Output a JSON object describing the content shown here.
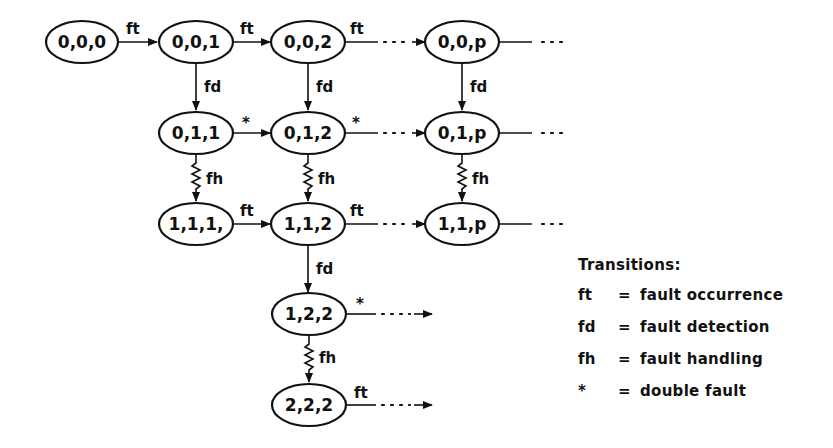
{
  "diagram": {
    "type": "state-transition",
    "nodes": [
      {
        "id": "n000",
        "label": "0,0,0",
        "cx": 82,
        "cy": 42
      },
      {
        "id": "n001",
        "label": "0,0,1",
        "cx": 196,
        "cy": 42
      },
      {
        "id": "n002",
        "label": "0,0,2",
        "cx": 308,
        "cy": 42
      },
      {
        "id": "n00p",
        "label": "0,0,p",
        "cx": 462,
        "cy": 42
      },
      {
        "id": "n011",
        "label": "0,1,1",
        "cx": 196,
        "cy": 133
      },
      {
        "id": "n012",
        "label": "0,1,2",
        "cx": 308,
        "cy": 133
      },
      {
        "id": "n01p",
        "label": "0,1,p",
        "cx": 462,
        "cy": 133
      },
      {
        "id": "n111",
        "label": "1,1,1,",
        "cx": 196,
        "cy": 224
      },
      {
        "id": "n112",
        "label": "1,1,2",
        "cx": 308,
        "cy": 224
      },
      {
        "id": "n11p",
        "label": "1,1,p",
        "cx": 462,
        "cy": 224
      },
      {
        "id": "n122",
        "label": "1,2,2",
        "cx": 309,
        "cy": 314
      },
      {
        "id": "n222",
        "label": "2,2,2",
        "cx": 309,
        "cy": 405
      }
    ],
    "edges": [
      {
        "from": "0,0,0",
        "to": "0,0,1",
        "label": "ft",
        "style": "solid"
      },
      {
        "from": "0,0,1",
        "to": "0,0,2",
        "label": "ft",
        "style": "solid"
      },
      {
        "from": "0,0,2",
        "to": "0,0,p",
        "label": "ft",
        "style": "dotted"
      },
      {
        "from": "0,0,p",
        "to": "...",
        "label": "",
        "style": "dotted"
      },
      {
        "from": "0,0,1",
        "to": "0,1,1",
        "label": "fd",
        "style": "solid"
      },
      {
        "from": "0,0,2",
        "to": "0,1,2",
        "label": "fd",
        "style": "solid"
      },
      {
        "from": "0,0,p",
        "to": "0,1,p",
        "label": "fd",
        "style": "solid"
      },
      {
        "from": "0,1,1",
        "to": "0,1,2",
        "label": "*",
        "style": "solid"
      },
      {
        "from": "0,1,2",
        "to": "0,1,p",
        "label": "*",
        "style": "dotted"
      },
      {
        "from": "0,1,p",
        "to": "...",
        "label": "",
        "style": "dotted"
      },
      {
        "from": "0,1,1",
        "to": "1,1,1,",
        "label": "fh",
        "style": "zigzag"
      },
      {
        "from": "0,1,2",
        "to": "1,1,2",
        "label": "fh",
        "style": "zigzag"
      },
      {
        "from": "0,1,p",
        "to": "1,1,p",
        "label": "fh",
        "style": "zigzag"
      },
      {
        "from": "1,1,1,",
        "to": "1,1,2",
        "label": "ft",
        "style": "solid"
      },
      {
        "from": "1,1,2",
        "to": "1,1,p",
        "label": "ft",
        "style": "dotted"
      },
      {
        "from": "1,1,p",
        "to": "...",
        "label": "",
        "style": "dotted"
      },
      {
        "from": "1,1,2",
        "to": "1,2,2",
        "label": "fd",
        "style": "solid"
      },
      {
        "from": "1,2,2",
        "to": "...",
        "label": "*",
        "style": "dotted"
      },
      {
        "from": "1,2,2",
        "to": "2,2,2",
        "label": "fh",
        "style": "zigzag"
      },
      {
        "from": "2,2,2",
        "to": "...",
        "label": "ft",
        "style": "dotted"
      }
    ]
  },
  "edge_labels": {
    "ft": "ft",
    "fd": "fd",
    "fh": "fh",
    "star": "*"
  },
  "legend": {
    "title": "Transitions:",
    "items": [
      {
        "symbol": "ft",
        "eq": "=",
        "meaning": "fault occurrence"
      },
      {
        "symbol": "fd",
        "eq": "=",
        "meaning": "fault detection"
      },
      {
        "symbol": "fh",
        "eq": "=",
        "meaning": "fault handling"
      },
      {
        "symbol": "*",
        "eq": "=",
        "meaning": "double fault"
      }
    ]
  }
}
